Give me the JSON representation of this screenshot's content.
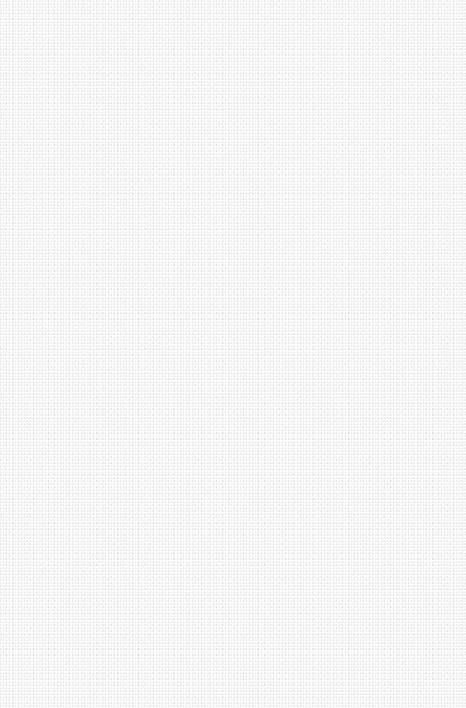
{
  "canvas": {
    "background_color": "#fdfdfd",
    "texture": "fine gray noise speckle",
    "content": ""
  }
}
